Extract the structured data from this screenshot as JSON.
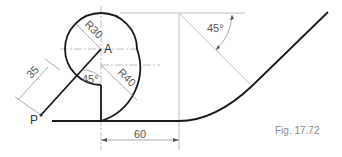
{
  "figure": {
    "caption": "Fig. 17.72",
    "points": {
      "A": "A",
      "P": "P"
    },
    "dimensions": {
      "radius_small": "R30",
      "radius_large": "R40",
      "length_35": "35",
      "length_60": "60",
      "angle_left": "45°",
      "angle_right": "45°"
    }
  }
}
